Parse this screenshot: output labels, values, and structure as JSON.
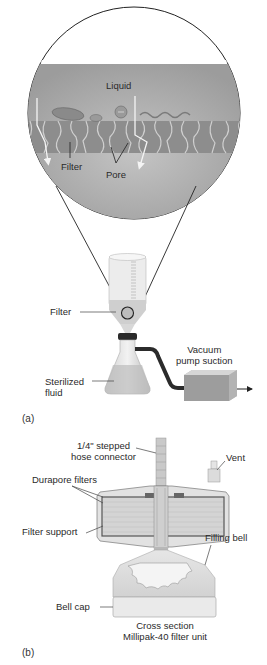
{
  "panel_a": {
    "label": "(a)",
    "magnified_view": {
      "liquid_label": "Liquid",
      "filter_label": "Filter",
      "pore_label": "Pore"
    },
    "apparatus": {
      "filter_label": "Filter",
      "sterilized_fluid_line1": "Sterilized",
      "sterilized_fluid_line2": "fluid",
      "vacuum_line1": "Vacuum",
      "vacuum_line2": "pump suction"
    }
  },
  "panel_b": {
    "label": "(b)",
    "hose_connector_line1": "1/4\" stepped",
    "hose_connector_line2": "hose connector",
    "vent_label": "Vent",
    "durapore_label": "Durapore filters",
    "filter_support_label": "Filter support",
    "filling_bell_label": "Filling bell",
    "bell_cap_label": "Bell cap",
    "caption_line1": "Cross section",
    "caption_line2": "Millipak-40 filter unit"
  },
  "colors": {
    "liquid_gray": "#a9a9a9",
    "filter_gray": "#8f8f8f",
    "dark_tube": "#2b2b2b",
    "pump_box": "#9a9a9a"
  }
}
